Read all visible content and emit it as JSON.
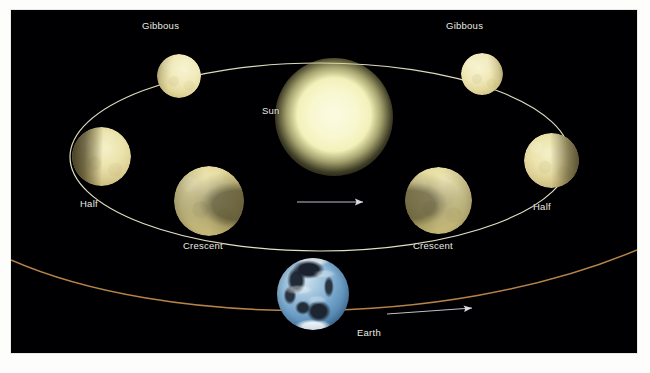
{
  "diagram": {
    "background_color": "#000002",
    "mount_color": "#fdfdfc"
  },
  "sun": {
    "label": "Sun",
    "color": "#f8f7cf",
    "glow_color": "#e2de96",
    "center": [
      320,
      107
    ],
    "radius": 36,
    "label_pos": [
      262,
      101
    ]
  },
  "earth": {
    "label": "Earth",
    "ocean_color": "#7fadd0",
    "land_color": "#222b38",
    "center": [
      313,
      295
    ],
    "radius": 36,
    "label_pos": [
      357,
      327
    ]
  },
  "orbit": {
    "name": "venus-orbit",
    "color": "#efeccd",
    "stroke_width": 1.2,
    "center": [
      320,
      122
    ],
    "rx": 250,
    "ry": 94,
    "direction_label": "counterclockwise"
  },
  "earth_orbit": {
    "name": "earth-orbit",
    "color": "#c08a4e",
    "stroke_width": 1.4
  },
  "arrows": [
    {
      "name": "venus-orbit-direction-arrow",
      "color": "#dfe3ea",
      "from": [
        297,
        202
      ],
      "to": [
        364,
        202
      ]
    },
    {
      "name": "earth-orbit-direction-arrow",
      "color": "#dfe3ea",
      "from": [
        388,
        311
      ],
      "to": [
        474,
        304
      ]
    }
  ],
  "phases": [
    {
      "id": "gibbous-left",
      "label": "Gibbous",
      "phase": "Gibbous",
      "center": [
        168,
        66
      ],
      "radius": 22,
      "label_pos": [
        142,
        20
      ]
    },
    {
      "id": "gibbous-right",
      "label": "Gibbous",
      "phase": "Gibbous",
      "center": [
        471,
        64
      ],
      "radius": 21,
      "label_pos": [
        446,
        20
      ]
    },
    {
      "id": "half-left",
      "label": "Half",
      "phase": "Half",
      "center": [
        101,
        157
      ],
      "radius": 29,
      "label_pos": [
        80,
        198
      ]
    },
    {
      "id": "half-right",
      "label": "Half",
      "phase": "Half",
      "center": [
        551,
        161
      ],
      "radius": 27,
      "label_pos": [
        533,
        201
      ]
    },
    {
      "id": "crescent-left",
      "label": "Crescent",
      "phase": "Crescent",
      "center": [
        208,
        200
      ],
      "radius": 35,
      "label_pos": [
        183,
        240
      ]
    },
    {
      "id": "crescent-right",
      "label": "Crescent",
      "phase": "Crescent",
      "center": [
        437,
        200
      ],
      "radius": 33,
      "label_pos": [
        413,
        240
      ]
    }
  ]
}
